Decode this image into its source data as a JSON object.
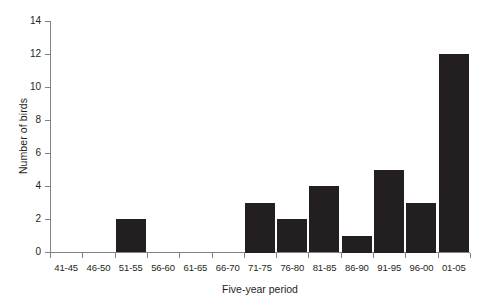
{
  "chart_data": {
    "type": "bar",
    "title": "",
    "xlabel": "Five-year period",
    "ylabel": "Number of birds",
    "categories": [
      "41-45",
      "46-50",
      "51-55",
      "56-60",
      "61-65",
      "66-70",
      "71-75",
      "76-80",
      "81-85",
      "86-90",
      "91-95",
      "96-00",
      "01-05"
    ],
    "values": [
      0,
      0,
      2,
      0,
      0,
      0,
      3,
      2,
      4,
      1,
      5,
      3,
      12
    ],
    "ylim": [
      0,
      14
    ],
    "y_ticks": [
      0,
      2,
      4,
      6,
      8,
      10,
      12,
      14
    ],
    "y_tick_labels": [
      "0",
      "2",
      "4",
      "6",
      "8",
      "10",
      "12",
      "14"
    ],
    "grid": false,
    "legend": false,
    "bar_color": "#231f20",
    "axis_color": "#808285",
    "background_color": "#ffffff"
  }
}
